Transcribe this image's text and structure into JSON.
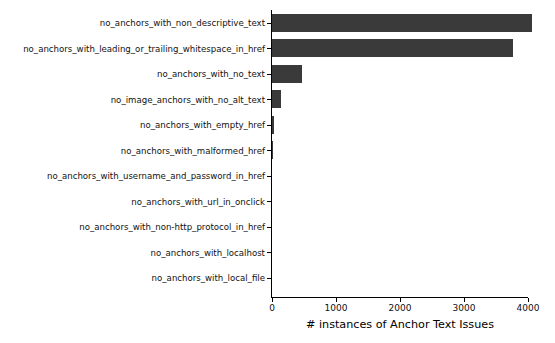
{
  "chart_data": {
    "type": "bar",
    "orientation": "horizontal",
    "title": "",
    "xlabel": "# instances of Anchor Text Issues",
    "ylabel": "",
    "xlim": [
      0,
      4200
    ],
    "xticks": [
      0,
      1000,
      2000,
      3000,
      4000
    ],
    "xtick_labels": [
      "0",
      "1000",
      "2000",
      "3000",
      "4000"
    ],
    "grid": false,
    "legend": null,
    "bar_color": "#3a3a3a",
    "background_color": "#ffffff",
    "categories": [
      "no_anchors_with_non_descriptive_text",
      "no_anchors_with_leading_or_trailing_whitespace_in_href",
      "no_anchors_with_no_text",
      "no_image_anchors_with_no_alt_text",
      "no_anchors_with_empty_href",
      "no_anchors_with_malformed_href",
      "no_anchors_with_username_and_password_in_href",
      "no_anchors_with_url_in_onclick",
      "no_anchors_with_non-http_protocol_in_href",
      "no_anchors_with_localhost",
      "no_anchors_with_local_file"
    ],
    "values": [
      4060,
      3760,
      470,
      140,
      25,
      20,
      0,
      0,
      0,
      0,
      0
    ]
  }
}
